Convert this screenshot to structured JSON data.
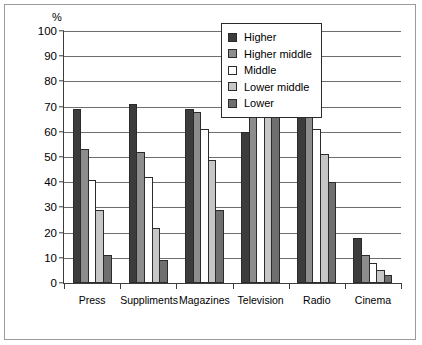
{
  "figure": {
    "unit_label": "%"
  },
  "legend": {
    "position": "top-right-inside",
    "entries": [
      {
        "label": "Higher",
        "color": "#3c3c3c"
      },
      {
        "label": "Higher middle",
        "color": "#8d8d8d"
      },
      {
        "label": "Middle",
        "color": "#ffffff"
      },
      {
        "label": "Lower middle",
        "color": "#c6c6c6"
      },
      {
        "label": "Lower",
        "color": "#6f6f6f"
      }
    ]
  },
  "chart_data": {
    "type": "bar",
    "title": "",
    "xlabel": "",
    "ylabel": "%",
    "ylim": [
      0,
      100
    ],
    "yticks": [
      0,
      10,
      20,
      30,
      40,
      50,
      60,
      70,
      80,
      90,
      100
    ],
    "grid": "horizontal",
    "legend_position": "top-right-inside",
    "categories": [
      "Press",
      "Suppliments",
      "Magazines",
      "Television",
      "Radio",
      "Cinema"
    ],
    "series": [
      {
        "name": "Higher",
        "color": "#3c3c3c",
        "values": [
          69,
          71,
          69,
          60,
          70,
          18
        ]
      },
      {
        "name": "Higher middle",
        "color": "#8d8d8d",
        "values": [
          53,
          52,
          68,
          89,
          67,
          11
        ]
      },
      {
        "name": "Middle",
        "color": "#ffffff",
        "values": [
          41,
          42,
          61,
          90,
          61,
          8
        ]
      },
      {
        "name": "Lower middle",
        "color": "#c6c6c6",
        "values": [
          29,
          22,
          49,
          91,
          51,
          5
        ]
      },
      {
        "name": "Lower",
        "color": "#6f6f6f",
        "values": [
          11,
          9,
          29,
          90,
          40,
          3
        ]
      }
    ]
  }
}
